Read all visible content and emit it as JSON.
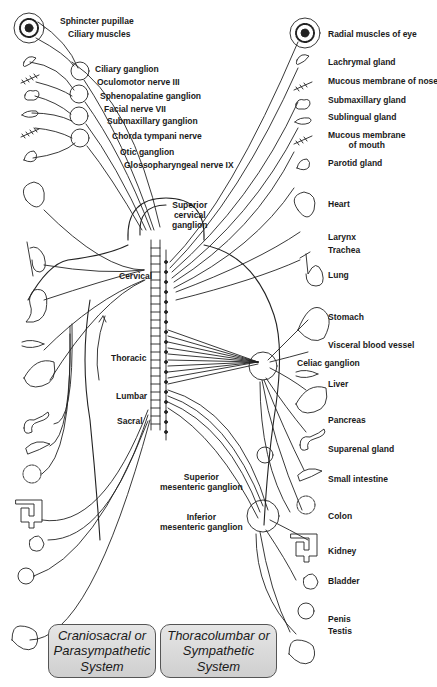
{
  "head_labels": {
    "sphincter": "Sphincter pupillae",
    "ciliary_muscles": "Ciliary muscles",
    "ciliary_ganglion": "Ciliary ganglion",
    "oculomotor": "Oculomotor nerve III",
    "sphenopalatine": "Sphenopalatine ganglion",
    "facial": "Facial nerve VII",
    "submaxillary_ganglion": "Submaxillary ganglion",
    "chorda": "Chorda tympani nerve",
    "otic": "Otic ganglion",
    "glosso": "Glossopharyngeal nerve IX"
  },
  "right_labels": {
    "radial": "Radial muscles of eye",
    "lachrymal": "Lachrymal gland",
    "nose": "Mucous membrane of nose",
    "submaxillary_gland": "Submaxillary gland",
    "sublingual": "Sublingual gland",
    "mouth1": "Mucous membrane",
    "mouth2": "of mouth",
    "parotid": "Parotid gland",
    "heart": "Heart",
    "larynx": "Larynx",
    "trachea": "Trachea",
    "lung": "Lung",
    "stomach": "Stomach",
    "vessel": "Visceral blood vessel",
    "celiac": "Celiac ganglion",
    "liver": "Liver",
    "pancreas": "Pancreas",
    "suprarenal": "Suparenal gland",
    "small_intestine": "Small intestine",
    "colon": "Colon",
    "kidney": "Kidney",
    "bladder": "Bladder",
    "penis": "Penis",
    "testis": "Testis"
  },
  "center_labels": {
    "superior_cervical": [
      "Superior",
      "cervical",
      "ganglion"
    ],
    "cervical": "Cervical",
    "thoracic": "Thoracic",
    "lumbar": "Lumbar",
    "sacral": "Sacral",
    "superior_mesenteric": [
      "Superior",
      "mesenteric ganglion"
    ],
    "inferior_mesenteric": [
      "Inferior",
      "mesenteric ganglion"
    ]
  },
  "legend": {
    "parasympathetic": [
      "Craniosacral or",
      "Parasympathetic",
      "System"
    ],
    "sympathetic": [
      "Thoracolumbar or",
      "Sympathetic",
      "System"
    ]
  }
}
